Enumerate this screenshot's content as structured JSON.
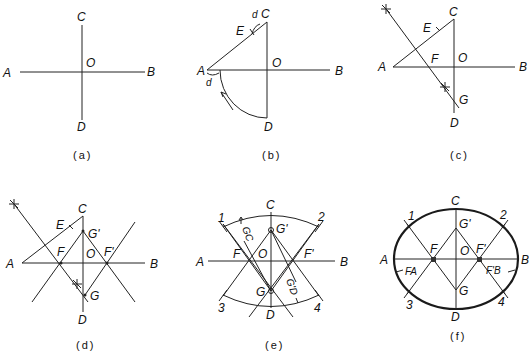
{
  "figure": {
    "panels": [
      {
        "id": "a",
        "caption": "(a)",
        "labels": {
          "A": "A",
          "B": "B",
          "C": "C",
          "D": "D",
          "O": "O"
        }
      },
      {
        "id": "b",
        "caption": "(b)",
        "labels": {
          "A": "A",
          "B": "B",
          "C": "C",
          "D": "D",
          "O": "O",
          "E": "E",
          "d1": "d",
          "d2": "d"
        }
      },
      {
        "id": "c",
        "caption": "(c)",
        "labels": {
          "A": "A",
          "B": "B",
          "C": "C",
          "D": "D",
          "O": "O",
          "E": "E",
          "F": "F",
          "G": "G"
        }
      },
      {
        "id": "d",
        "caption": "(d)",
        "labels": {
          "A": "A",
          "B": "B",
          "C": "C",
          "D": "D",
          "O": "O",
          "E": "E",
          "F": "F",
          "G": "G",
          "Fp": "F'",
          "Gp": "G'"
        }
      },
      {
        "id": "e",
        "caption": "(e)",
        "labels": {
          "A": "A",
          "B": "B",
          "C": "C",
          "D": "D",
          "O": "O",
          "F": "F",
          "G": "G",
          "Fp": "F'",
          "Gp": "G'",
          "n1": "1",
          "n2": "2",
          "n3": "3",
          "n4": "4",
          "GC": "GC",
          "GpD": "G'D"
        }
      },
      {
        "id": "f",
        "caption": "(f)",
        "labels": {
          "A": "A",
          "B": "B",
          "C": "C",
          "D": "D",
          "O": "O",
          "F": "F",
          "G": "G",
          "Fp": "F'",
          "Gp": "G'",
          "n1": "1",
          "n2": "2",
          "n3": "3",
          "n4": "4",
          "FA": "FA",
          "FpB": "F'B"
        }
      }
    ]
  }
}
